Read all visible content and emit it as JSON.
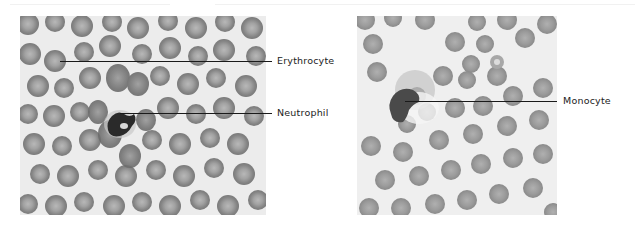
{
  "figure": {
    "panels": [
      {
        "id": "left",
        "description": "Blood smear micrograph showing erythrocytes and a neutrophil",
        "labels": [
          {
            "text": "Erythrocyte",
            "target": "erythrocyte"
          },
          {
            "text": "Neutrophil",
            "target": "neutrophil"
          }
        ]
      },
      {
        "id": "right",
        "description": "Blood smear micrograph showing erythrocytes and a monocyte",
        "labels": [
          {
            "text": "Monocyte",
            "target": "monocyte"
          }
        ]
      }
    ],
    "colors": {
      "background": "#ffffff",
      "plasma": "#ebebeb",
      "erythrocyte": "#8c8c8c",
      "erythrocyte_center": "#b4b4b4",
      "nucleus": "#2a2a2a",
      "leader_line": "#1a1a1a",
      "label_text": "#222222"
    }
  }
}
